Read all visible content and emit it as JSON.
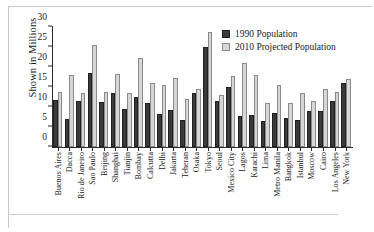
{
  "chart_data": {
    "type": "bar",
    "title": "",
    "subtitle": "",
    "xlabel": "",
    "ylabel": "Shown in Millions",
    "ylim": [
      0,
      30
    ],
    "yticks": [
      0,
      5,
      10,
      15,
      20,
      25,
      30
    ],
    "grid": false,
    "legend_position": "top-right",
    "categories": [
      "Buenos Aires",
      "Dacca",
      "Rio de Janeiro",
      "Sao Paulo",
      "Beijing",
      "Shanghai",
      "Tianjin",
      "Bombay",
      "Calcutta",
      "Delhi",
      "Jakarta",
      "Teheran",
      "Osaka",
      "Tokyo",
      "Seoul",
      "Mexico City",
      "Lagos",
      "Karachi",
      "Lima",
      "Metro Manila",
      "Bangkok",
      "Istanbul",
      "Moscow",
      "Cairo",
      "Los Angeles",
      "New York"
    ],
    "series": [
      {
        "name": "1990 Population",
        "color": "#3a3a3a",
        "values": [
          11.8,
          6.9,
          11.4,
          18.4,
          11.2,
          13.4,
          9.6,
          12.5,
          11.0,
          8.3,
          9.3,
          6.8,
          13.6,
          25.0,
          11.6,
          15.1,
          7.7,
          8.0,
          6.5,
          8.5,
          7.2,
          6.7,
          9.0,
          9.0,
          11.5,
          16.1
        ]
      },
      {
        "name": "2010 Projected Population",
        "color": "#d6d6d6",
        "values": [
          13.7,
          17.9,
          13.6,
          25.4,
          13.7,
          18.3,
          13.4,
          22.3,
          15.9,
          15.6,
          17.2,
          12.0,
          14.5,
          28.7,
          13.0,
          17.8,
          21.1,
          18.0,
          11.0,
          15.6,
          10.9,
          13.6,
          11.6,
          14.4,
          13.8,
          17.0
        ]
      }
    ]
  },
  "legend": {
    "items": [
      {
        "label": "1990 Population"
      },
      {
        "label": "2010 Projected Population"
      }
    ]
  }
}
